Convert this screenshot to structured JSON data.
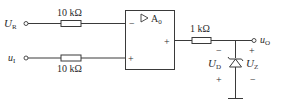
{
  "diagram": {
    "type": "op-amp comparator circuit",
    "inputs": [
      {
        "id": "UR",
        "symbol": "U",
        "subscript": "R",
        "resistor_label": "10 kΩ",
        "opamp_pin": "-"
      },
      {
        "id": "u1",
        "symbol": "u",
        "subscript": "I",
        "resistor_label": "10 kΩ",
        "opamp_pin": "+"
      }
    ],
    "opamp": {
      "label": "A",
      "label_subscript": "0",
      "symbol": "▷",
      "inverting_sign": "−",
      "noninverting_sign": "+",
      "output_sign": "+"
    },
    "output_resistor": {
      "label": "1 kΩ"
    },
    "output": {
      "symbol": "u",
      "subscript": "O"
    },
    "zener": {
      "left_label": "U",
      "left_subscript": "D",
      "right_label": "U",
      "right_subscript": "Z",
      "left_top_sign": "−",
      "left_bottom_sign": "+",
      "right_top_sign": "+",
      "right_bottom_sign": "−"
    }
  }
}
